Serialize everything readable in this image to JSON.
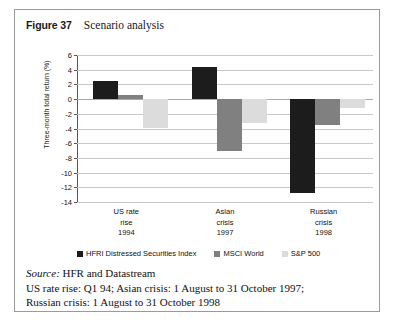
{
  "figure": {
    "label": "Figure 37",
    "caption": "Scenario analysis"
  },
  "chart_data": {
    "type": "bar",
    "title": "Scenario analysis",
    "xlabel": "",
    "ylabel": "Three-month total return (%)",
    "ylim": [
      -14,
      6
    ],
    "yticks": [
      6,
      4,
      2,
      0,
      -2,
      -4,
      -6,
      -8,
      -10,
      -12,
      -14
    ],
    "grid": true,
    "legend_position": "bottom",
    "categories": [
      "US rate rise 1994",
      "Asian crisis 1997",
      "Russian crisis 1998"
    ],
    "category_lines": [
      [
        "US rate",
        "rise",
        "1994"
      ],
      [
        "Asian",
        "crisis",
        "1997"
      ],
      [
        "Russian",
        "crisis",
        "1998"
      ]
    ],
    "series": [
      {
        "name": "HFRI Distressed Securities Index",
        "color": "#1c1c1c",
        "values": [
          2.5,
          4.3,
          -12.8
        ]
      },
      {
        "name": "MSCI World",
        "color": "#808080",
        "values": [
          0.6,
          -7.0,
          -3.5
        ]
      },
      {
        "name": "S&P 500",
        "color": "#dcdcdc",
        "values": [
          -4.0,
          -3.3,
          -1.2
        ]
      }
    ]
  },
  "notes": {
    "source_word": "Source:",
    "source_text": "HFR and Datastream",
    "line2": "US rate rise: Q1 94; Asian crisis: 1 August to 31 October 1997;",
    "line3": "Russian crisis: 1 August to 31 October 1998"
  }
}
